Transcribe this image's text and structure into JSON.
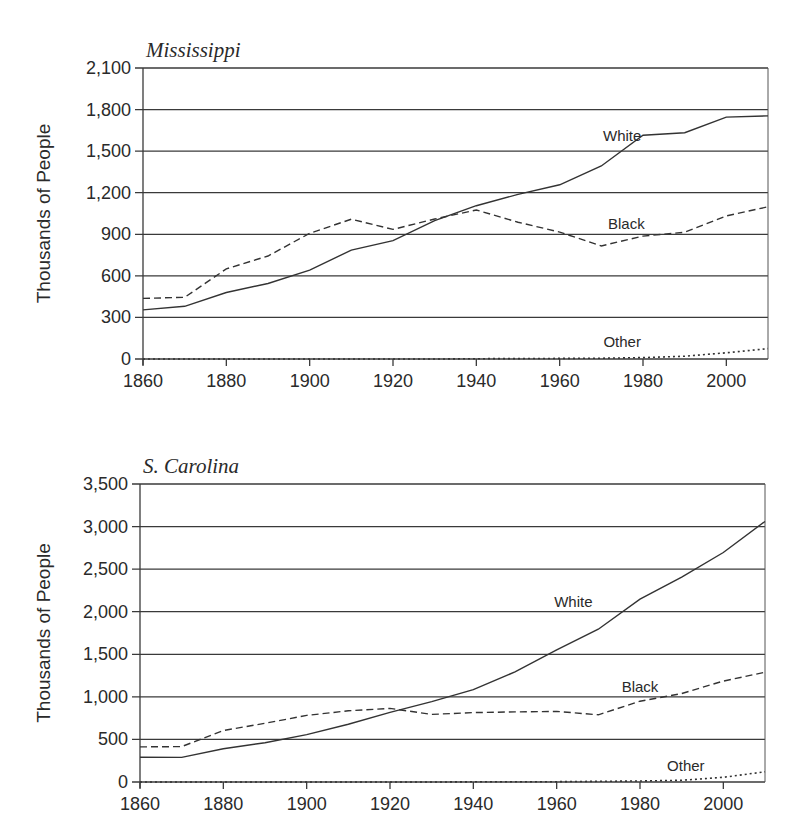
{
  "figure": {
    "ylabel": "Thousands of People",
    "series_names": [
      "White",
      "Black",
      "Other"
    ]
  },
  "chart_data": [
    {
      "type": "line",
      "title": "Mississippi",
      "xlabel": "",
      "ylabel": "Thousands of People",
      "x": [
        1860,
        1870,
        1880,
        1890,
        1900,
        1910,
        1920,
        1930,
        1940,
        1950,
        1960,
        1970,
        1980,
        1990,
        2000,
        2010
      ],
      "xticks": [
        1860,
        1880,
        1900,
        1920,
        1940,
        1960,
        1980,
        2000
      ],
      "xtick_labels": [
        "1860",
        "1880",
        "1900",
        "1920",
        "1940",
        "1960",
        "1980",
        "2000"
      ],
      "yticks": [
        0,
        300,
        600,
        900,
        1200,
        1500,
        1800,
        2100
      ],
      "ytick_labels": [
        "0",
        "300",
        "600",
        "900",
        "1,200",
        "1,500",
        "1,800",
        "2,100"
      ],
      "xlim": [
        1860,
        2010
      ],
      "ylim": [
        0,
        2100
      ],
      "grid": "horizontal",
      "legend": "inline labels",
      "series": [
        {
          "name": "White",
          "style": "solid",
          "values": [
            354,
            380,
            480,
            545,
            641,
            786,
            854,
            998,
            1106,
            1188,
            1257,
            1393,
            1615,
            1633,
            1746,
            1754
          ],
          "label_pos": [
            1975,
            1570
          ]
        },
        {
          "name": "Black",
          "style": "dashed",
          "values": [
            437,
            445,
            650,
            743,
            907,
            1009,
            935,
            1010,
            1075,
            987,
            916,
            816,
            887,
            915,
            1033,
            1098
          ],
          "label_pos": [
            1976,
            935
          ]
        },
        {
          "name": "Other",
          "style": "dotted",
          "values": [
            0,
            0,
            0,
            0,
            0,
            0,
            0,
            0,
            2,
            3,
            4,
            6,
            10,
            20,
            45,
            75
          ],
          "label_pos": [
            1975,
            85
          ]
        }
      ]
    },
    {
      "type": "line",
      "title": "S. Carolina",
      "xlabel": "",
      "ylabel": "Thousands of People",
      "x": [
        1860,
        1870,
        1880,
        1890,
        1900,
        1910,
        1920,
        1930,
        1940,
        1950,
        1960,
        1970,
        1980,
        1990,
        2000,
        2010
      ],
      "xticks": [
        1860,
        1880,
        1900,
        1920,
        1940,
        1960,
        1980,
        2000
      ],
      "xtick_labels": [
        "1860",
        "1880",
        "1900",
        "1920",
        "1940",
        "1960",
        "1980",
        "2000"
      ],
      "yticks": [
        0,
        500,
        1000,
        1500,
        2000,
        2500,
        3000,
        3500
      ],
      "ytick_labels": [
        "0",
        "500",
        "1,000",
        "1,500",
        "2,000",
        "2,500",
        "3,000",
        "3,500"
      ],
      "xlim": [
        1860,
        2010
      ],
      "ylim": [
        0,
        3500
      ],
      "grid": "horizontal",
      "legend": "inline labels",
      "series": [
        {
          "name": "White",
          "style": "solid",
          "values": [
            291,
            289,
            391,
            462,
            557,
            679,
            818,
            944,
            1085,
            1293,
            1551,
            1795,
            2147,
            2407,
            2695,
            3060
          ],
          "label_pos": [
            1964,
            2050
          ]
        },
        {
          "name": "Black",
          "style": "dashed",
          "values": [
            412,
            416,
            605,
            689,
            782,
            836,
            865,
            794,
            815,
            823,
            829,
            789,
            949,
            1040,
            1185,
            1290
          ],
          "label_pos": [
            1980,
            1060
          ]
        },
        {
          "name": "Other",
          "style": "dotted",
          "values": [
            0,
            0,
            0,
            0,
            0,
            0,
            0,
            0,
            2,
            3,
            4,
            8,
            12,
            20,
            55,
            120
          ],
          "label_pos": [
            1991,
            135
          ]
        }
      ]
    }
  ]
}
